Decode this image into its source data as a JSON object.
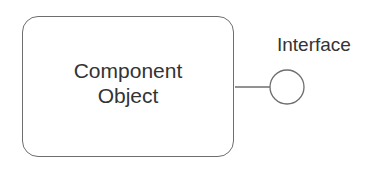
{
  "diagram": {
    "component": {
      "line1": "Component",
      "line2": "Object"
    },
    "interface": {
      "label": "Interface"
    },
    "colors": {
      "stroke": "#6e6e6e",
      "text": "#333333",
      "background": "#ffffff"
    }
  }
}
